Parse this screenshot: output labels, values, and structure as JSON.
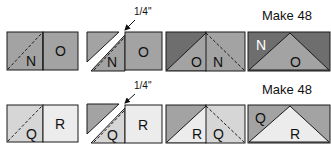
{
  "colors": {
    "medium_gray": "#a3a3a3",
    "dark_gray": "#6e6e6e",
    "light_gray": "#d6d6d6",
    "very_light_gray": "#ececec",
    "outline": "#1a1a1a"
  },
  "row1": {
    "step1": {
      "left_label": "N",
      "right_label": "O"
    },
    "step2": {
      "left_label": "N",
      "right_label": "O",
      "measure": "1/4\""
    },
    "step3": {
      "left_label": "O",
      "right_label": "N"
    },
    "step4": {
      "caption": "Make 48",
      "corner_label": "N",
      "center_label": "O"
    }
  },
  "row2": {
    "step1": {
      "left_label": "Q",
      "right_label": "R"
    },
    "step2": {
      "left_label": "Q",
      "right_label": "R",
      "measure": "1/4\""
    },
    "step3": {
      "left_label": "R",
      "right_label": "Q"
    },
    "step4": {
      "caption": "Make 48",
      "corner_label": "Q",
      "center_label": "R"
    }
  }
}
